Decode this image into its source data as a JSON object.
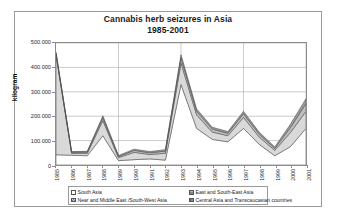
{
  "chart_data": {
    "type": "area",
    "stacked": true,
    "title": "Cannabis herb seizures in Asia",
    "subtitle": "1985-2001",
    "xlabel": "",
    "ylabel": "kilogram",
    "ylim": [
      0,
      500000
    ],
    "yticks": [
      "0",
      "100.000",
      "200.000",
      "300.000",
      "400.000",
      "500.000"
    ],
    "ytick_values": [
      0,
      100000,
      200000,
      300000,
      400000,
      500000
    ],
    "grid": true,
    "legend_position": "bottom",
    "categories": [
      "1985",
      "1986",
      "1987",
      "1988",
      "1989",
      "1990",
      "1991",
      "1992",
      "1993",
      "1994",
      "1995",
      "1996",
      "1997",
      "1998",
      "1999",
      "2000",
      "2001"
    ],
    "series": [
      {
        "name": "South Asia",
        "color": "#ffffff",
        "values": [
          42000,
          40000,
          38000,
          120000,
          18000,
          22000,
          25000,
          20000,
          330000,
          150000,
          105000,
          95000,
          150000,
          85000,
          38000,
          75000,
          150000
        ]
      },
      {
        "name": "Near and Middle East /South-West Asia",
        "color": "#d9d9d9",
        "values": [
          410000,
          8000,
          10000,
          62000,
          12000,
          30000,
          18000,
          28000,
          88000,
          55000,
          30000,
          25000,
          45000,
          30000,
          22000,
          58000,
          70000
        ]
      },
      {
        "name": "East and South-East Asia",
        "color": "#bfbfbf",
        "values": [
          6000,
          4000,
          5000,
          12000,
          5000,
          8000,
          7000,
          9000,
          22000,
          15000,
          12000,
          10000,
          15000,
          12000,
          8000,
          20000,
          32000
        ]
      },
      {
        "name": "Central Asia  and Transcaucasian countries",
        "color": "#9d9d9d",
        "values": [
          4000,
          3000,
          3000,
          8000,
          4000,
          5000,
          5000,
          6000,
          12000,
          10000,
          8000,
          7000,
          10000,
          8000,
          6000,
          14000,
          20000
        ]
      }
    ],
    "totals": [
      462000,
      55000,
      56000,
      202000,
      39000,
      65000,
      55000,
      63000,
      452000,
      230000,
      155000,
      137000,
      220000,
      135000,
      74000,
      167000,
      272000
    ]
  },
  "legend": {
    "items": [
      {
        "label": "South Asia",
        "swatch": "sw-p1"
      },
      {
        "label": "East and South-East Asia",
        "swatch": "sw-p3"
      },
      {
        "label": "Near and Middle East /South-West Asia",
        "swatch": "sw-p2"
      },
      {
        "label": "Central Asia  and Transcaucasian countries",
        "swatch": "sw-p4"
      }
    ]
  }
}
